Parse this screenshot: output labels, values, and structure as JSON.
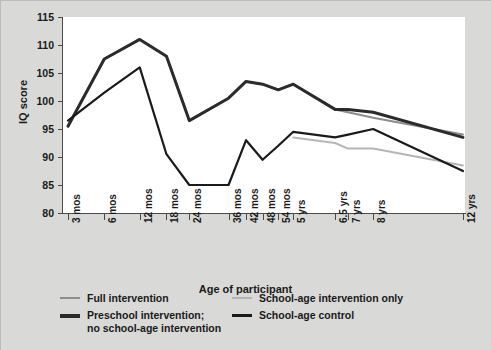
{
  "chart_data": {
    "type": "line",
    "title": "",
    "xlabel": "Age of participant",
    "ylabel": "IQ score",
    "ylim": [
      80,
      115
    ],
    "yticks": [
      80,
      85,
      90,
      95,
      100,
      105,
      110,
      115
    ],
    "grid": false,
    "legend_position": "bottom-left",
    "categories": [
      "3 mos",
      "6 mos",
      "12 mos",
      "18 mos",
      "24 mos",
      "36 mos",
      "42 mos",
      "48 mos",
      "54 mos",
      "5 yrs",
      "6.5 yrs",
      "7 yrs",
      "8 yrs",
      "12 yrs"
    ],
    "x_months": [
      3,
      6,
      12,
      18,
      24,
      36,
      42,
      48,
      54,
      60,
      78,
      84,
      96,
      144
    ],
    "series": [
      {
        "name": "Full intervention",
        "color": "#8c8c8c",
        "width": 2.0,
        "values": [
          95.5,
          107.5,
          111.0,
          108.0,
          96.5,
          100.5,
          103.5,
          103.0,
          102.0,
          103.0,
          98.5,
          98.0,
          97.0,
          94.0
        ]
      },
      {
        "name": "School-age intervention only",
        "color": "#b5b5b5",
        "width": 2.0,
        "values": [
          null,
          null,
          null,
          null,
          null,
          null,
          null,
          null,
          null,
          93.5,
          92.5,
          91.5,
          91.5,
          88.5
        ]
      },
      {
        "name": "Preschool intervention;\nno school-age intervention",
        "color": "#2b2b2b",
        "width": 3.0,
        "values": [
          95.5,
          107.5,
          111.0,
          108.0,
          96.5,
          100.5,
          103.5,
          103.0,
          102.0,
          103.0,
          98.5,
          98.5,
          98.0,
          93.5
        ]
      },
      {
        "name": "School-age control",
        "color": "#1a1a1a",
        "width": 2.2,
        "values": [
          96.5,
          101.5,
          106.0,
          90.5,
          85.0,
          85.0,
          93.0,
          89.5,
          92.0,
          94.5,
          93.5,
          94.0,
          95.0,
          87.5
        ]
      }
    ]
  },
  "axes": {
    "y_title": "IQ score",
    "x_title": "Age of participant",
    "y_tick_labels": [
      "115",
      "110",
      "105",
      "100",
      "95",
      "90",
      "85",
      "80"
    ],
    "x_tick_labels": [
      "3 mos",
      "6 mos",
      "12 mos",
      "18 mos",
      "24 mos",
      "36 mos",
      "42 mos",
      "48 mos",
      "54 mos",
      "5 yrs",
      "6.5 yrs",
      "7 yrs",
      "8 yrs",
      "12 yrs"
    ]
  },
  "legend": {
    "items": [
      {
        "label": "Full intervention",
        "color": "#8c8c8c",
        "thickness": "2px"
      },
      {
        "label": "Preschool intervention;\nno school-age intervention",
        "color": "#2b2b2b",
        "thickness": "4px"
      },
      {
        "label": "School-age intervention only",
        "color": "#b5b5b5",
        "thickness": "2px"
      },
      {
        "label": "School-age control",
        "color": "#1a1a1a",
        "thickness": "3px"
      }
    ]
  },
  "colors": {
    "background": "#d9d9d7",
    "plot_background": "#ffffff",
    "axis": "#4a4a4a",
    "text": "#1a1a1a"
  }
}
